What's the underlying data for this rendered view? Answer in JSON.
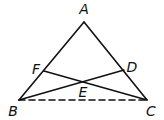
{
  "diagram": {
    "type": "geometry-triangle",
    "points": {
      "A": {
        "x": 84,
        "y": 22,
        "label": "A",
        "lx": 84,
        "ly": 14
      },
      "B": {
        "x": 19,
        "y": 100,
        "label": "B",
        "lx": 13,
        "ly": 116
      },
      "C": {
        "x": 147,
        "y": 100,
        "label": "C",
        "lx": 151,
        "ly": 116
      },
      "D": {
        "x": 124,
        "y": 70,
        "label": "D",
        "lx": 132,
        "ly": 72
      },
      "E": {
        "x": 83,
        "y": 81,
        "label": "E",
        "lx": 83,
        "ly": 97
      },
      "F": {
        "x": 44,
        "y": 71,
        "label": "F",
        "lx": 36,
        "ly": 74
      }
    },
    "segments": [
      {
        "from": "A",
        "to": "B",
        "style": "solid"
      },
      {
        "from": "A",
        "to": "C",
        "style": "solid"
      },
      {
        "from": "B",
        "to": "D",
        "style": "solid"
      },
      {
        "from": "C",
        "to": "F",
        "style": "solid"
      },
      {
        "from": "B",
        "to": "C",
        "style": "dashed"
      }
    ],
    "stroke_color": "#111111"
  }
}
